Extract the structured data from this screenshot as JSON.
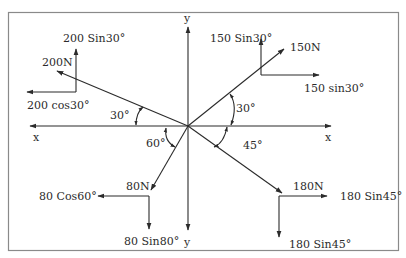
{
  "diagram": {
    "axes": {
      "x_left_label": "x",
      "x_right_label": "x",
      "y_top_label": "y",
      "y_bottom_label": "y"
    },
    "forces": [
      {
        "name": "200N",
        "label": "200N",
        "angle_label": "30°",
        "component_h_label": "200 cos30°",
        "component_v_label": "200 Sin30°",
        "quadrant": "upper-left"
      },
      {
        "name": "150N",
        "label": "150N",
        "angle_label": "30°",
        "component_h_label": "150 sin30°",
        "component_v_label": "150 Sin30°",
        "quadrant": "upper-right"
      },
      {
        "name": "80N",
        "label": "80N",
        "angle_label": "60°",
        "component_h_label": "80 Cos60°",
        "component_v_label": "80 Sin80°",
        "quadrant": "lower-left"
      },
      {
        "name": "180N",
        "label": "180N",
        "angle_label": "45°",
        "component_h_label": "180 Sin45°",
        "component_v_label": "180 Sin45°",
        "quadrant": "lower-right"
      }
    ],
    "colors": {
      "ink": "#2b2b2b",
      "frame": "#8a8a8a",
      "background": "#ffffff"
    }
  }
}
